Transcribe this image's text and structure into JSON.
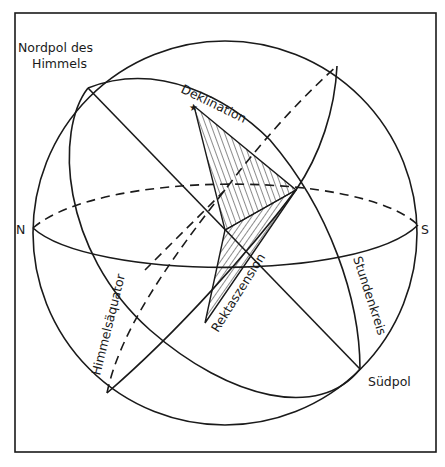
{
  "diagram": {
    "labels": {
      "north_celestial_pole": [
        "Nordpol des",
        "Himmels"
      ],
      "declination": "Deklination",
      "north": "N",
      "south": "S",
      "celestial_equator": "Himmelsäquator",
      "right_ascension": "Rektaszension",
      "hour_circle": "Stundenkreis",
      "south_pole": "Südpol"
    },
    "colors": {
      "ink": "#1a1a1a",
      "background": "#ffffff"
    }
  }
}
